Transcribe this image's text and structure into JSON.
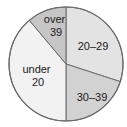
{
  "chart_data": {
    "type": "pie",
    "title": "",
    "subtitle": "",
    "xlabel": "",
    "ylabel": "",
    "legend_position": "none",
    "grid": false,
    "labels_on_slices": true,
    "categories": [
      "20–29",
      "30–39",
      "under 20",
      "over 39"
    ],
    "values": [
      30,
      20,
      39,
      11
    ],
    "start_angle_deg": 0,
    "direction": "clockwise",
    "slices": [
      {
        "label": "20–29",
        "label_line1": "20–29",
        "label_line2": "",
        "value": 30,
        "start_deg": 0,
        "end_deg": 108,
        "color": "#e3e3e3",
        "label_x": 93,
        "label_y": 47
      },
      {
        "label": "30–39",
        "label_line1": "30–39",
        "label_line2": "",
        "value": 20,
        "start_deg": 108,
        "end_deg": 180,
        "color": "#d2d2d2",
        "label_x": 92,
        "label_y": 98
      },
      {
        "label": "under 20",
        "label_line1": "under",
        "label_line2": "20",
        "value": 39,
        "start_deg": 180,
        "end_deg": 320,
        "color": "#f2f2f2",
        "label_x": 38,
        "label_y": 76
      },
      {
        "label": "over 39",
        "label_line1": "over",
        "label_line2": "39",
        "value": 11,
        "start_deg": 320,
        "end_deg": 360,
        "color": "#c6c6c6",
        "label_x": 56,
        "label_y": 26
      }
    ],
    "geometry": {
      "center_x": 66,
      "center_y": 64,
      "radius": 57
    },
    "colors": {
      "background": "#ffffff",
      "outline": "#6b6b6b",
      "divider": "#6b6b6b",
      "text": "#1a1a1a"
    }
  }
}
